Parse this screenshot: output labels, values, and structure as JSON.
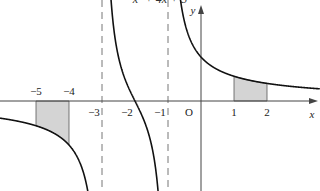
{
  "title_fragment": "x² + 4x + 3",
  "chart_data": {
    "type": "line",
    "xlabel": "x",
    "ylabel": "y",
    "origin_label": "O",
    "x_ticks": [
      "−5",
      "−4",
      "−3",
      "−2",
      "−1",
      "1",
      "2"
    ],
    "vertical_asymptotes": [
      -3,
      -1
    ],
    "x_intercept": -2,
    "shaded_regions": [
      {
        "from": -5,
        "to": -4,
        "side": "below"
      },
      {
        "from": 1,
        "to": 2,
        "side": "above"
      }
    ],
    "branches": [
      {
        "domain": [
          -6,
          -3
        ],
        "behavior": "negative, decreasing toward −∞ near x=−3"
      },
      {
        "domain": [
          -3,
          -1
        ],
        "behavior": "decreasing from +∞ to −∞, crossing x-axis at −2"
      },
      {
        "domain": [
          -1,
          3.5
        ],
        "behavior": "positive, decreasing from +∞ toward 0"
      }
    ],
    "grid": false
  }
}
